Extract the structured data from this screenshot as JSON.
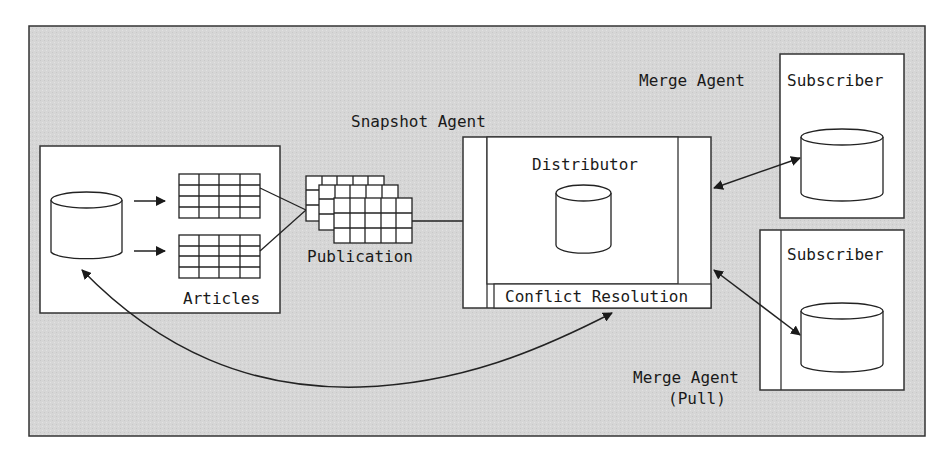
{
  "diagram": {
    "type": "merge-replication-architecture",
    "colors": {
      "background": "#d4d4d4",
      "box_fill": "#ffffff",
      "stroke": "#222222"
    },
    "labels": {
      "snapshot_agent": "Snapshot Agent",
      "merge_agent_push": "Merge Agent",
      "merge_agent_pull_line1": "Merge Agent",
      "merge_agent_pull_line2": "(Pull)",
      "distributor": "Distributor",
      "conflict_resolution": "Conflict Resolution",
      "publication": "Publication",
      "articles": "Articles",
      "subscriber_1": "Subscriber",
      "subscriber_2": "Subscriber"
    },
    "nodes": [
      {
        "id": "publisher",
        "contains": [
          "publisher-database",
          "articles"
        ]
      },
      {
        "id": "publication",
        "label": "Publication"
      },
      {
        "id": "distributor",
        "label": "Distributor",
        "contains": [
          "distribution-database",
          "conflict-resolution"
        ]
      },
      {
        "id": "subscriber-1",
        "label": "Subscriber"
      },
      {
        "id": "subscriber-2",
        "label": "Subscriber"
      }
    ],
    "edges": [
      {
        "from": "publisher-database",
        "to": "article-table-1",
        "direction": "forward"
      },
      {
        "from": "publisher-database",
        "to": "article-table-2",
        "direction": "forward"
      },
      {
        "from": "articles",
        "to": "publication",
        "direction": "none"
      },
      {
        "from": "publication",
        "to": "distributor",
        "label": "Snapshot Agent",
        "direction": "none"
      },
      {
        "from": "distributor",
        "to": "subscriber-1",
        "label": "Merge Agent",
        "direction": "both"
      },
      {
        "from": "distributor",
        "to": "subscriber-2",
        "label": "Merge Agent (Pull)",
        "direction": "both"
      },
      {
        "from": "conflict-resolution",
        "to": "publisher-database",
        "direction": "both"
      }
    ]
  }
}
